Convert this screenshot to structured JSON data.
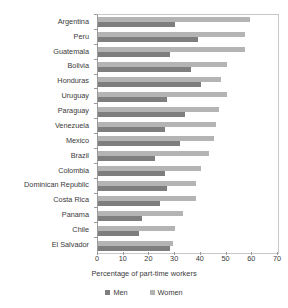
{
  "chart_data": {
    "type": "bar",
    "orientation": "horizontal",
    "title": "",
    "xlabel": "Percentage of part-time workers",
    "ylabel": "",
    "xlim": [
      0,
      70
    ],
    "xticks": [
      0,
      10,
      20,
      30,
      40,
      50,
      60,
      70
    ],
    "grid": false,
    "legend_position": "bottom",
    "categories": [
      "Argentina",
      "Peru",
      "Guatemala",
      "Bolivia",
      "Honduras",
      "Uruguay",
      "Paraguay",
      "Venezuela",
      "Mexico",
      "Brazil",
      "Colombia",
      "Dominican Republic",
      "Costa Rica",
      "Panama",
      "Chile",
      "El Salvador"
    ],
    "series": [
      {
        "name": "Women",
        "color": "#b4b4b4",
        "values": [
          59,
          57,
          57,
          50,
          48,
          50,
          47,
          46,
          45,
          43,
          40,
          38,
          38,
          33,
          30,
          29
        ]
      },
      {
        "name": "Men",
        "color": "#7e7e7e",
        "values": [
          30,
          39,
          28,
          36,
          40,
          27,
          34,
          26,
          32,
          22,
          26,
          27,
          24,
          17,
          16,
          28
        ]
      }
    ]
  },
  "legend": {
    "entries": [
      {
        "label": "Men",
        "color": "#7e7e7e"
      },
      {
        "label": "Women",
        "color": "#b4b4b4"
      }
    ]
  }
}
